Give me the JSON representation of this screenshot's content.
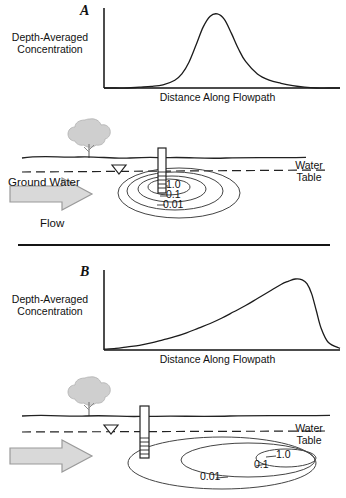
{
  "figure": {
    "type": "hydrogeology-schematic",
    "panels": [
      "A",
      "B"
    ],
    "divider": true
  },
  "panel_a": {
    "letter": "A",
    "chart": {
      "ylabel_line1": "Depth-Averaged",
      "ylabel_line2": "Concentration",
      "xlabel": "Distance Along Flowpath"
    },
    "cross_section": {
      "groundwater_label_line1": "Ground Water",
      "groundwater_label_line2": "Flow",
      "water_table_line1": "Water",
      "water_table_line2": "Table",
      "contours": [
        "1.0",
        "0.1",
        "0.01"
      ],
      "icons": {
        "tree": "tree-icon",
        "well": "monitoring-well-icon",
        "water_table_symbol": "water-table-triangle-icon",
        "flow_arrow": "flow-arrow-icon"
      }
    }
  },
  "panel_b": {
    "letter": "B",
    "chart": {
      "ylabel_line1": "Depth-Averaged",
      "ylabel_line2": "Concentration",
      "xlabel": "Distance Along Flowpath"
    },
    "cross_section": {
      "water_table_line1": "Water",
      "water_table_line2": "Table",
      "contours": [
        "1.0",
        "0.1",
        "0.01"
      ],
      "icons": {
        "tree": "tree-icon",
        "well": "monitoring-well-icon",
        "water_table_symbol": "water-table-triangle-icon",
        "flow_arrow": "flow-arrow-icon"
      }
    }
  },
  "colors": {
    "ink": "#111111",
    "line": "#333333",
    "gray_fill": "#d4d4d4",
    "gray_stroke": "#8a8a8a",
    "tree_fill": "#cfcfcf"
  },
  "chart_data": [
    {
      "type": "line",
      "id": "panel-a-plume-profile",
      "title": "A",
      "xlabel": "Distance Along Flowpath",
      "ylabel": "Depth-Averaged Concentration",
      "xlim": [
        0,
        100
      ],
      "ylim": [
        0,
        100
      ],
      "grid": false,
      "legend": null,
      "axis_ticks": false,
      "description": "Sharp symmetric peak near source well",
      "x": [
        0,
        5,
        10,
        15,
        20,
        25,
        30,
        33,
        36,
        39,
        42,
        45,
        48,
        51,
        54,
        57,
        60,
        65,
        70,
        75,
        80,
        85,
        90,
        95,
        100
      ],
      "y": [
        0,
        0,
        0,
        1,
        2,
        4,
        10,
        18,
        33,
        55,
        78,
        92,
        95,
        88,
        70,
        50,
        34,
        18,
        10,
        6,
        3,
        1,
        0,
        0,
        0
      ]
    },
    {
      "type": "line",
      "id": "panel-b-plume-profile",
      "title": "B",
      "xlabel": "Distance Along Flowpath",
      "ylabel": "Depth-Averaged Concentration",
      "xlim": [
        0,
        100
      ],
      "ylim": [
        0,
        100
      ],
      "grid": false,
      "legend": null,
      "axis_ticks": false,
      "description": "Gradual rise to a distant downgradient maximum with abrupt decline",
      "x": [
        0,
        5,
        10,
        15,
        20,
        25,
        30,
        35,
        40,
        45,
        50,
        55,
        60,
        65,
        70,
        75,
        78,
        81,
        84,
        86,
        88,
        90,
        92,
        95,
        100
      ],
      "y": [
        1,
        2,
        4,
        6,
        9,
        13,
        17,
        22,
        28,
        34,
        41,
        49,
        57,
        66,
        75,
        84,
        88,
        91,
        90,
        85,
        72,
        50,
        28,
        10,
        2
      ]
    }
  ]
}
